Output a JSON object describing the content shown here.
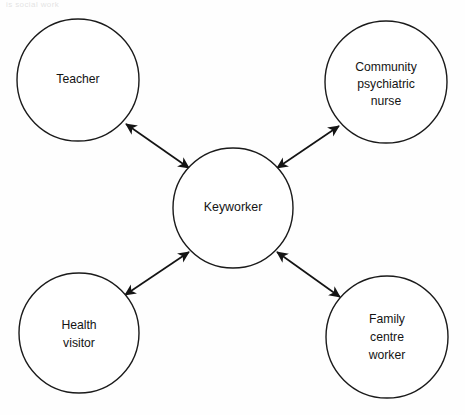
{
  "figure": {
    "clipped_header_text": "is social work",
    "background_color": "#fefefe",
    "stroke_color": "#141414"
  },
  "diagram": {
    "type": "hub-and-spoke",
    "center": {
      "id": "keyworker",
      "label": "Keyworker",
      "lines": [
        "Keyworker"
      ],
      "cx": 233,
      "cy": 208,
      "r": 60
    },
    "nodes": [
      {
        "id": "teacher",
        "label": "Teacher",
        "lines": [
          "Teacher"
        ],
        "cx": 78,
        "cy": 80,
        "r": 61,
        "position": "top-left"
      },
      {
        "id": "community-psychiatric-nurse",
        "label": "Community psychiatric nurse",
        "lines": [
          "Community",
          "psychiatric",
          "nurse"
        ],
        "cx": 386,
        "cy": 82,
        "r": 61,
        "position": "top-right"
      },
      {
        "id": "health-visitor",
        "label": "Health visitor",
        "lines": [
          "Health",
          "visitor"
        ],
        "cx": 79,
        "cy": 333,
        "r": 60,
        "position": "bottom-left"
      },
      {
        "id": "family-centre-worker",
        "label": "Family centre worker",
        "lines": [
          "Family",
          "centre",
          "worker"
        ],
        "cx": 387,
        "cy": 337,
        "r": 61,
        "position": "bottom-right"
      }
    ],
    "connectors": [
      {
        "id": "teacher-keyworker",
        "from": "teacher",
        "to": "keyworker",
        "arrow": "double"
      },
      {
        "id": "cpn-keyworker",
        "from": "community-psychiatric-nurse",
        "to": "keyworker",
        "arrow": "double"
      },
      {
        "id": "health-visitor-keyworker",
        "from": "health-visitor",
        "to": "keyworker",
        "arrow": "double"
      },
      {
        "id": "family-centre-worker-keyworker",
        "from": "family-centre-worker",
        "to": "keyworker",
        "arrow": "double"
      }
    ]
  }
}
